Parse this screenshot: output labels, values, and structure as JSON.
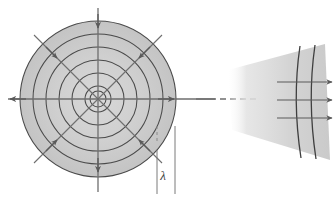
{
  "figure": {
    "background_color": "#ffffff",
    "stroke_color": "#555555",
    "arc_color": "#444444",
    "axis_color": "#6e6e6e",
    "fill_color": "#cfcfcf",
    "fill_color_light": "#dedede"
  },
  "spherical_source": {
    "label": "spherical-wavefronts",
    "center": {
      "x": 98,
      "y": 99
    },
    "wavefront_radii": [
      8,
      13,
      26,
      39,
      52,
      65,
      78
    ],
    "outer_disc_radius": 78,
    "wavelength_annotation": {
      "symbol": "λ",
      "tick_left_x": 157,
      "tick_right_x": 175,
      "tick_top_y": 126,
      "tick_bottom_y": 194,
      "label_x": 163,
      "label_y": 178
    },
    "rays": [
      {
        "name": "ray-up",
        "angle_deg": 270,
        "arrow_at_radius": 74,
        "line_extends_to": 96
      },
      {
        "name": "ray-down",
        "angle_deg": 90,
        "arrow_at_radius": 74,
        "line_extends_to": 96
      },
      {
        "name": "ray-left",
        "angle_deg": 180,
        "arrow_at_radius": 92,
        "line_extends_to": 92
      },
      {
        "name": "ray-right",
        "angle_deg": 0,
        "arrow_at_radius": 74,
        "line_extends_to": 108
      },
      {
        "name": "ray-upper-left",
        "angle_deg": 225,
        "arrow_at_radius": 62,
        "line_extends_to": 90
      },
      {
        "name": "ray-upper-right",
        "angle_deg": 315,
        "arrow_at_radius": 62,
        "line_extends_to": 90
      },
      {
        "name": "ray-lower-left",
        "angle_deg": 135,
        "arrow_at_radius": 62,
        "line_extends_to": 90
      },
      {
        "name": "ray-lower-right",
        "angle_deg": 45,
        "arrow_at_radius": 62,
        "line_extends_to": 90
      }
    ]
  },
  "connector": {
    "label": "axis-connector",
    "solid_from_x": 196,
    "solid_to_x": 215,
    "dash_from_x": 220,
    "dash_to_x": 258,
    "y": 99,
    "dash_pattern": "6 4"
  },
  "plane_section": {
    "label": "plane-wavefronts-far-field",
    "wedge_points": "228,70 325,44 330,160 232,130",
    "arcs": [
      {
        "name": "wavefront-arc-near",
        "d": "M 300,46 Q 292,100 301,158"
      },
      {
        "name": "wavefront-arc-far",
        "d": "M 315,45 Q 307,100 316,159"
      }
    ],
    "rays": [
      {
        "name": "plane-ray-top",
        "x1": 277,
        "x2": 333,
        "y": 82
      },
      {
        "name": "plane-ray-middle",
        "x1": 277,
        "x2": 333,
        "y": 100
      },
      {
        "name": "plane-ray-bottom",
        "x1": 277,
        "x2": 333,
        "y": 118
      }
    ]
  }
}
